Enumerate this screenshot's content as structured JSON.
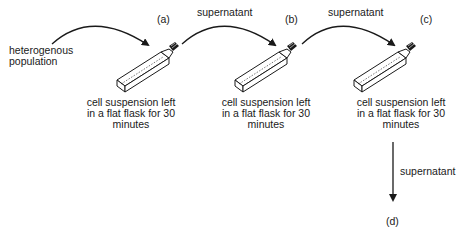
{
  "input_label": [
    "heterogenous",
    "population"
  ],
  "stages": [
    {
      "id": "(a)",
      "caption": [
        "cell suspension left",
        "in a flat flask for 30",
        "minutes"
      ]
    },
    {
      "id": "(b)",
      "caption": [
        "cell suspension left",
        "in a flat flask for 30",
        "minutes"
      ]
    },
    {
      "id": "(c)",
      "caption": [
        "cell suspension left",
        "in a flat flask for 30",
        "minutes"
      ]
    }
  ],
  "transfer_label": "supernatant",
  "final_stage": "(d)",
  "colors": {
    "ink": "#1a1a1a",
    "background": "#ffffff"
  }
}
